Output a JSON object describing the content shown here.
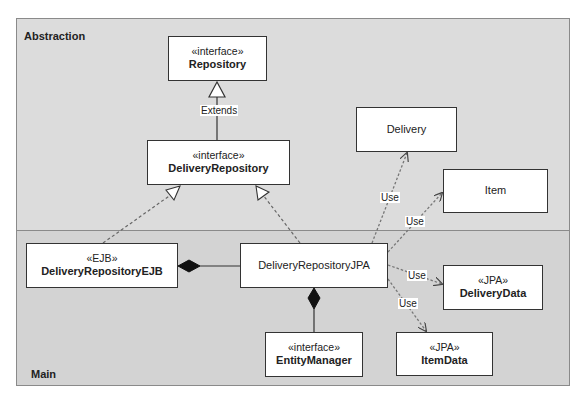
{
  "packages": {
    "abstraction": {
      "label": "Abstraction"
    },
    "main": {
      "label": "Main"
    }
  },
  "classes": {
    "repository": {
      "stereotype": "«interface»",
      "name": "Repository"
    },
    "delivery_repository": {
      "stereotype": "«interface»",
      "name": "DeliveryRepository"
    },
    "delivery": {
      "name": "Delivery"
    },
    "item": {
      "name": "Item"
    },
    "delivery_repository_ejb": {
      "stereotype": "«EJB»",
      "name": "DeliveryRepositoryEJB"
    },
    "delivery_repository_jpa": {
      "name": "DeliveryRepositoryJPA"
    },
    "delivery_data": {
      "stereotype": "«JPA»",
      "name": "DeliveryData"
    },
    "entity_manager": {
      "stereotype": "«interface»",
      "name": "EntityManager"
    },
    "item_data": {
      "stereotype": "«JPA»",
      "name": "ItemData"
    }
  },
  "relationships": {
    "extends": {
      "label": "Extends",
      "from": "DeliveryRepository",
      "to": "Repository",
      "type": "generalization"
    },
    "ejb_realizes": {
      "from": "DeliveryRepositoryEJB",
      "to": "DeliveryRepository",
      "type": "realization"
    },
    "jpa_realizes": {
      "from": "DeliveryRepositoryJPA",
      "to": "DeliveryRepository",
      "type": "realization"
    },
    "ejb_composes_jpa": {
      "from": "DeliveryRepositoryEJB",
      "to": "DeliveryRepositoryJPA",
      "type": "composition"
    },
    "jpa_composes_em": {
      "from": "DeliveryRepositoryJPA",
      "to": "EntityManager",
      "type": "composition"
    },
    "use_delivery": {
      "label": "Use",
      "from": "DeliveryRepositoryJPA",
      "to": "Delivery",
      "type": "dependency"
    },
    "use_item": {
      "label": "Use",
      "from": "DeliveryRepositoryJPA",
      "to": "Item",
      "type": "dependency"
    },
    "use_delivery_data": {
      "label": "Use",
      "from": "DeliveryRepositoryJPA",
      "to": "DeliveryData",
      "type": "dependency"
    },
    "use_item_data": {
      "label": "Use",
      "from": "DeliveryRepositoryJPA",
      "to": "ItemData",
      "type": "dependency"
    }
  },
  "colors": {
    "abstraction_bg": "#dcdcdc",
    "main_bg": "#d3d3d3",
    "box_bg": "#ffffff",
    "line": "#333333",
    "dashed": "#666666"
  }
}
